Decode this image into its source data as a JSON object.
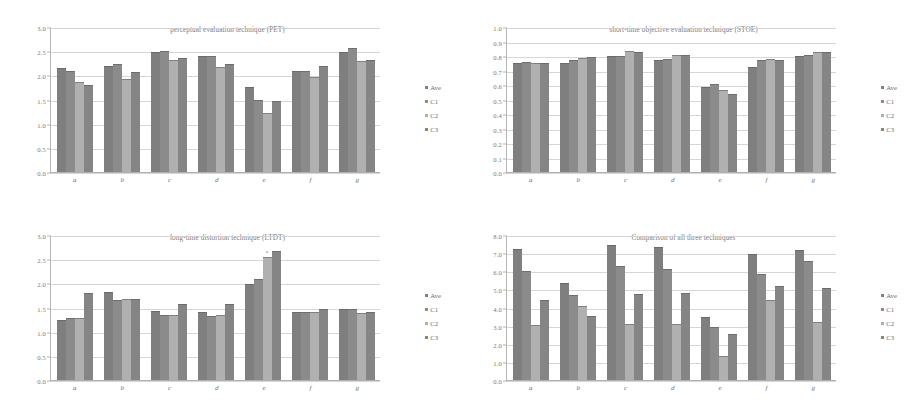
{
  "page": {
    "background": "#ffffff",
    "figure_layout": "2x2 grid of grouped bar charts",
    "series_colors": [
      "#7f7f7f",
      "#8b8b8b",
      "#b0b0b0",
      "#858585"
    ]
  },
  "chart_data": [
    {
      "type": "bar",
      "title": "perceptual evaluation technique (PET)",
      "xlabel": "",
      "ylabel": "",
      "categories": [
        "a",
        "b",
        "c",
        "d",
        "e",
        "f",
        "g"
      ],
      "yticks": [
        "0.0",
        "0.5",
        "1.0",
        "1.5",
        "2.0",
        "2.5",
        "3.0"
      ],
      "ylim": [
        0,
        3.0
      ],
      "grid": true,
      "legend": [
        "Ave",
        "C1",
        "C2",
        "C3"
      ],
      "legend_position": "right",
      "series": [
        {
          "name": "Ave",
          "values": [
            2.15,
            2.2,
            2.48,
            2.4,
            1.75,
            2.09,
            2.49
          ]
        },
        {
          "name": "C1",
          "values": [
            2.09,
            2.24,
            2.5,
            2.39,
            1.48,
            2.1,
            2.56
          ]
        },
        {
          "name": "C2",
          "values": [
            1.86,
            1.93,
            2.31,
            2.18,
            1.23,
            1.96,
            2.3
          ]
        },
        {
          "name": "C3",
          "values": [
            1.81,
            2.07,
            2.35,
            2.24,
            1.47,
            2.19,
            2.32
          ]
        }
      ]
    },
    {
      "type": "bar",
      "title": "short-time objective evaluation technique (STOE)",
      "xlabel": "",
      "ylabel": "",
      "categories": [
        "a",
        "b",
        "c",
        "d",
        "e",
        "f",
        "g"
      ],
      "yticks": [
        "0.0",
        "0.1",
        "0.2",
        "0.3",
        "0.4",
        "0.5",
        "0.6",
        "0.7",
        "0.8",
        "0.9",
        "1.0"
      ],
      "ylim": [
        0,
        1.0
      ],
      "grid": true,
      "legend": [
        "Ave",
        "C1",
        "C2",
        "C3"
      ],
      "legend_position": "right",
      "series": [
        {
          "name": "Ave",
          "values": [
            0.75,
            0.755,
            0.8,
            0.77,
            0.585,
            0.725,
            0.8
          ]
        },
        {
          "name": "C1",
          "values": [
            0.76,
            0.77,
            0.8,
            0.78,
            0.605,
            0.775,
            0.81
          ]
        },
        {
          "name": "C2",
          "values": [
            0.755,
            0.785,
            0.835,
            0.805,
            0.565,
            0.78,
            0.83
          ]
        },
        {
          "name": "C3",
          "values": [
            0.755,
            0.79,
            0.83,
            0.805,
            0.535,
            0.775,
            0.83
          ]
        }
      ]
    },
    {
      "type": "bar",
      "title": "long-time distortion technique (LTDT)",
      "xlabel": "",
      "ylabel": "",
      "categories": [
        "a",
        "b",
        "c",
        "d",
        "e",
        "f",
        "g"
      ],
      "yticks": [
        "0.0",
        "0.5",
        "1.0",
        "1.5",
        "2.0",
        "2.5",
        "3.0"
      ],
      "ylim": [
        0,
        3.0
      ],
      "grid": true,
      "legend": [
        "Ave",
        "C1",
        "C2",
        "C3"
      ],
      "legend_position": "right",
      "annotations": [
        {
          "text": "*",
          "category": "e",
          "series": "C2"
        }
      ],
      "series": [
        {
          "name": "Ave",
          "values": [
            1.25,
            1.83,
            1.42,
            1.4,
            1.99,
            1.4,
            1.46
          ]
        },
        {
          "name": "C1",
          "values": [
            1.29,
            1.65,
            1.34,
            1.33,
            2.09,
            1.4,
            1.46
          ]
        },
        {
          "name": "C2",
          "values": [
            1.28,
            1.67,
            1.34,
            1.34,
            2.55,
            1.4,
            1.38
          ]
        },
        {
          "name": "C3",
          "values": [
            1.8,
            1.68,
            1.58,
            1.58,
            2.67,
            1.46,
            1.41
          ]
        }
      ]
    },
    {
      "type": "bar",
      "title": "Comparison of all three techniques",
      "xlabel": "",
      "ylabel": "",
      "categories": [
        "a",
        "b",
        "c",
        "d",
        "e",
        "f",
        "g"
      ],
      "yticks": [
        "0.0",
        "1.0",
        "2.0",
        "3.0",
        "4.0",
        "5.0",
        "6.0",
        "7.0",
        "8.0"
      ],
      "ylim": [
        0,
        8.0
      ],
      "grid": true,
      "legend": [
        "Ave",
        "C1",
        "C2",
        "C3"
      ],
      "legend_position": "right",
      "series": [
        {
          "name": "Ave",
          "values": [
            7.25,
            5.35,
            7.45,
            7.35,
            3.45,
            6.95,
            7.15
          ]
        },
        {
          "name": "C1",
          "values": [
            6.0,
            4.7,
            6.3,
            6.15,
            2.95,
            5.85,
            6.55
          ]
        },
        {
          "name": "C2",
          "values": [
            3.05,
            4.1,
            3.1,
            3.1,
            1.35,
            4.4,
            3.2
          ]
        },
        {
          "name": "C3",
          "values": [
            4.4,
            3.55,
            4.75,
            4.8,
            2.55,
            5.2,
            5.1
          ]
        }
      ]
    }
  ]
}
